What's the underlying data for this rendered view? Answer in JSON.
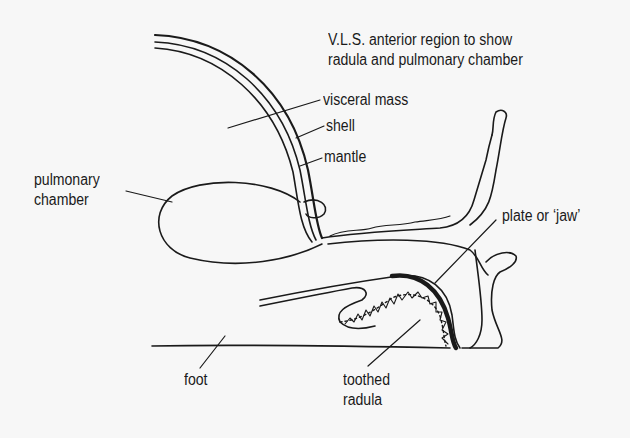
{
  "diagram": {
    "title_line1": "V.L.S. anterior region to show",
    "title_line2": "radula and pulmonary chamber",
    "labels": {
      "visceral_mass": "visceral mass",
      "shell": "shell",
      "mantle": "mantle",
      "pulmonary_line1": "pulmonary",
      "pulmonary_line2": "chamber",
      "plate": "plate or ‘jaw’",
      "foot": "foot",
      "radula_line1": "toothed",
      "radula_line2": "radula"
    },
    "colors": {
      "ink": "#1a1a1a",
      "background": "#f7f7f7"
    }
  }
}
